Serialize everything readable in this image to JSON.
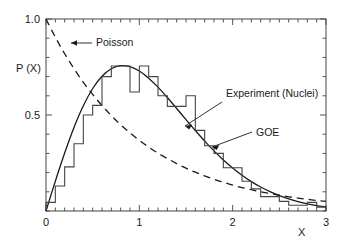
{
  "chart_data": {
    "type": "line",
    "title": "",
    "subtitle": "",
    "xlabel": "X",
    "ylabel": "P (X)",
    "xlim": [
      0,
      3
    ],
    "ylim": [
      0,
      1.0
    ],
    "grid": false,
    "legend_position": "inline-annotations",
    "x_ticks": [
      {
        "value": 0,
        "label": "0"
      },
      {
        "value": 1,
        "label": "1"
      },
      {
        "value": 2,
        "label": "2"
      },
      {
        "value": 3,
        "label": "3"
      }
    ],
    "y_ticks": [
      {
        "value": 0.5,
        "label": "0.5"
      },
      {
        "value": 1.0,
        "label": "1.0"
      }
    ],
    "x_minor_tick_step": 0.1,
    "y_minor_tick_step": 0.1,
    "annotations": [
      {
        "text": "Poisson",
        "target_x": 0.15,
        "target_y": 0.86
      },
      {
        "text": "Experiment (Nuclei)",
        "target_x": 1.42,
        "target_y": 0.62
      },
      {
        "text": "GOE",
        "target_x": 1.52,
        "target_y": 0.44
      }
    ],
    "series": [
      {
        "name": "Poisson",
        "style": "dashed",
        "formula": "exp(-x)",
        "x": [
          0.0,
          0.1,
          0.2,
          0.3,
          0.4,
          0.5,
          0.6,
          0.7,
          0.8,
          0.9,
          1.0,
          1.1,
          1.2,
          1.3,
          1.4,
          1.5,
          1.6,
          1.7,
          1.8,
          1.9,
          2.0,
          2.1,
          2.2,
          2.3,
          2.4,
          2.5,
          2.6,
          2.7,
          2.8,
          2.9,
          3.0
        ],
        "values": [
          1.0,
          0.905,
          0.819,
          0.741,
          0.67,
          0.607,
          0.549,
          0.497,
          0.449,
          0.407,
          0.368,
          0.333,
          0.301,
          0.273,
          0.247,
          0.223,
          0.202,
          0.183,
          0.165,
          0.15,
          0.135,
          0.122,
          0.111,
          0.1,
          0.091,
          0.082,
          0.074,
          0.067,
          0.061,
          0.055,
          0.05
        ]
      },
      {
        "name": "GOE",
        "style": "solid",
        "formula": "(pi/2)*x*exp(-pi*x^2/4)",
        "x": [
          0.0,
          0.1,
          0.2,
          0.3,
          0.4,
          0.5,
          0.6,
          0.7,
          0.8,
          0.9,
          1.0,
          1.1,
          1.2,
          1.3,
          1.4,
          1.5,
          1.6,
          1.7,
          1.8,
          1.9,
          2.0,
          2.1,
          2.2,
          2.3,
          2.4,
          2.5,
          2.6,
          2.7,
          2.8,
          2.9,
          3.0
        ],
        "values": [
          0.0,
          0.155,
          0.302,
          0.435,
          0.548,
          0.638,
          0.702,
          0.741,
          0.757,
          0.752,
          0.729,
          0.692,
          0.645,
          0.591,
          0.534,
          0.476,
          0.419,
          0.364,
          0.313,
          0.266,
          0.224,
          0.186,
          0.153,
          0.125,
          0.101,
          0.08,
          0.063,
          0.049,
          0.037,
          0.028,
          0.021
        ]
      },
      {
        "name": "Experiment (Nuclei)",
        "style": "histogram",
        "bin_width": 0.1,
        "bin_starts": [
          0.0,
          0.1,
          0.2,
          0.3,
          0.4,
          0.5,
          0.6,
          0.7,
          0.8,
          0.9,
          1.0,
          1.1,
          1.2,
          1.3,
          1.4,
          1.5,
          1.6,
          1.7,
          1.8,
          1.9,
          2.0,
          2.1,
          2.2,
          2.3,
          2.4,
          2.5,
          2.6,
          2.7,
          2.8,
          2.9
        ],
        "values": [
          0.045,
          0.13,
          0.23,
          0.35,
          0.5,
          0.55,
          0.7,
          0.755,
          0.755,
          0.62,
          0.755,
          0.7,
          0.6,
          0.545,
          0.545,
          0.6,
          0.42,
          0.34,
          0.3,
          0.225,
          0.225,
          0.155,
          0.115,
          0.075,
          0.075,
          0.05,
          0.03,
          0.03,
          0.045,
          0.02
        ]
      }
    ]
  },
  "axes": {
    "y_label": "P (X)",
    "x_label": "X"
  }
}
